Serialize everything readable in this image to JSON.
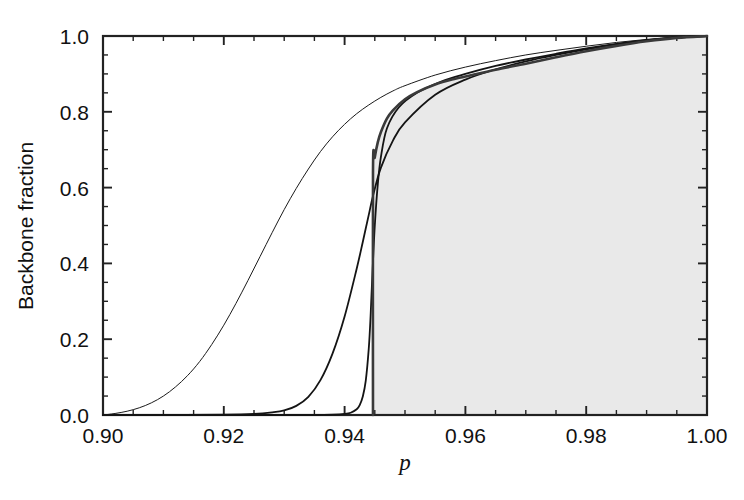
{
  "chart_data": {
    "type": "line",
    "title": "",
    "xlabel": "p",
    "ylabel": "Backbone fraction",
    "xlim": [
      0.9,
      1.0
    ],
    "ylim": [
      0.0,
      1.0
    ],
    "grid": false,
    "legend": "none",
    "xticks": [
      0.9,
      0.92,
      0.94,
      0.96,
      0.98,
      1.0
    ],
    "xticklabels": [
      "0.90",
      "0.92",
      "0.94",
      "0.96",
      "0.98",
      "1.00"
    ],
    "xminor_step": 0.005,
    "yticks": [
      0.0,
      0.2,
      0.4,
      0.6,
      0.8,
      1.0
    ],
    "yticklabels": [
      "0.0",
      "0.2",
      "0.4",
      "0.6",
      "0.8",
      "1.0"
    ],
    "yminor_step": 0.05,
    "shaded_region": {
      "fill_color": "#e9e9e9",
      "description": "region to the right of the infinite-size (sharpest) transition curve, under the curve",
      "edge_x": 0.9447
    },
    "critical_point": 0.9447,
    "series": [
      {
        "name": "smallest system size",
        "linewidth": 1.0,
        "color": "#1a1a1a",
        "x": [
          0.9,
          0.902,
          0.904,
          0.906,
          0.908,
          0.91,
          0.912,
          0.914,
          0.916,
          0.918,
          0.92,
          0.922,
          0.924,
          0.926,
          0.928,
          0.93,
          0.932,
          0.934,
          0.936,
          0.938,
          0.94,
          0.942,
          0.944,
          0.946,
          0.948,
          0.95,
          0.955,
          0.96,
          0.965,
          0.97,
          0.975,
          0.98,
          0.985,
          0.99,
          0.995,
          1.0
        ],
        "y": [
          0.0,
          0.004,
          0.01,
          0.019,
          0.032,
          0.05,
          0.074,
          0.104,
          0.141,
          0.186,
          0.237,
          0.294,
          0.355,
          0.418,
          0.481,
          0.542,
          0.598,
          0.649,
          0.695,
          0.734,
          0.767,
          0.795,
          0.818,
          0.838,
          0.855,
          0.869,
          0.897,
          0.918,
          0.935,
          0.95,
          0.962,
          0.973,
          0.983,
          0.991,
          0.997,
          1.0
        ]
      },
      {
        "name": "intermediate system size",
        "linewidth": 1.8,
        "color": "#141414",
        "x": [
          0.9,
          0.91,
          0.92,
          0.925,
          0.928,
          0.93,
          0.932,
          0.934,
          0.936,
          0.938,
          0.94,
          0.942,
          0.943,
          0.944,
          0.9447,
          0.946,
          0.948,
          0.95,
          0.955,
          0.96,
          0.965,
          0.97,
          0.975,
          0.98,
          0.985,
          0.99,
          0.995,
          1.0
        ],
        "y": [
          0.0,
          0.0,
          0.001,
          0.003,
          0.007,
          0.012,
          0.024,
          0.048,
          0.092,
          0.162,
          0.26,
          0.386,
          0.456,
          0.528,
          0.578,
          0.652,
          0.724,
          0.772,
          0.845,
          0.885,
          0.912,
          0.933,
          0.95,
          0.965,
          0.978,
          0.988,
          0.996,
          1.0
        ]
      },
      {
        "name": "largest system size",
        "linewidth": 1.8,
        "color": "#141414",
        "x": [
          0.9,
          0.92,
          0.93,
          0.935,
          0.938,
          0.94,
          0.941,
          0.942,
          0.9425,
          0.943,
          0.9435,
          0.944,
          0.9443,
          0.9446,
          0.945,
          0.9455,
          0.946,
          0.947,
          0.949,
          0.952,
          0.956,
          0.96,
          0.965,
          0.97,
          0.975,
          0.98,
          0.985,
          0.99,
          0.995,
          1.0
        ],
        "y": [
          0.0,
          0.0,
          0.0,
          0.0,
          0.001,
          0.003,
          0.006,
          0.015,
          0.026,
          0.048,
          0.09,
          0.175,
          0.26,
          0.37,
          0.5,
          0.61,
          0.68,
          0.756,
          0.812,
          0.85,
          0.88,
          0.9,
          0.921,
          0.938,
          0.953,
          0.967,
          0.979,
          0.989,
          0.996,
          1.0
        ]
      },
      {
        "name": "infinite system (thermodynamic limit)",
        "linewidth": 2.6,
        "color": "#3a3a3a",
        "x": [
          0.9447,
          0.9447,
          0.945,
          0.9455,
          0.946,
          0.947,
          0.948,
          0.95,
          0.952,
          0.955,
          0.958,
          0.96,
          0.965,
          0.97,
          0.975,
          0.98,
          0.985,
          0.99,
          0.995,
          1.0
        ],
        "y": [
          0.0,
          0.64,
          0.68,
          0.72,
          0.746,
          0.782,
          0.804,
          0.833,
          0.852,
          0.872,
          0.886,
          0.893,
          0.911,
          0.927,
          0.944,
          0.96,
          0.974,
          0.986,
          0.995,
          1.0
        ]
      }
    ]
  },
  "axes": {
    "frame_color": "#222222",
    "x_title": "p",
    "y_title": "Backbone fraction"
  }
}
